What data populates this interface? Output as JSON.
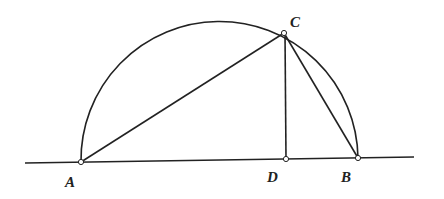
{
  "diagram": {
    "type": "geometry",
    "points": {
      "A": {
        "label": "A",
        "x": 81,
        "y": 162
      },
      "B": {
        "label": "B",
        "x": 358,
        "y": 158
      },
      "C": {
        "label": "C",
        "x": 284,
        "y": 33
      },
      "D": {
        "label": "D",
        "x": 286,
        "y": 159
      }
    },
    "segments": [
      "AC",
      "CB",
      "CD",
      "AB"
    ],
    "stroke_color": "#222222"
  }
}
